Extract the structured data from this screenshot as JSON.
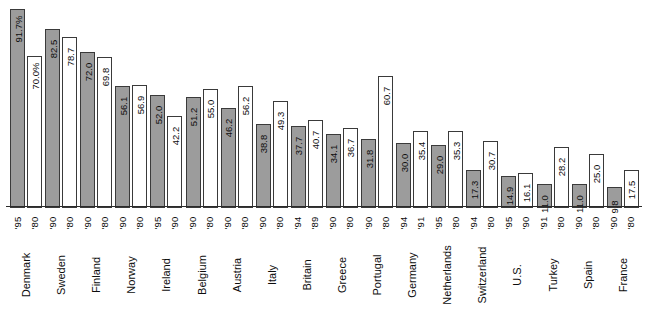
{
  "chart_data": {
    "type": "bar",
    "title": "",
    "subtitle": "",
    "xlabel": "",
    "ylabel": "",
    "ylim": [
      0,
      95
    ],
    "grid": false,
    "legend_position": "none",
    "orientation": "vertical",
    "categories": [
      "Denmark",
      "Sweden",
      "Finland",
      "Norway",
      "Ireland",
      "Belgium",
      "Austria",
      "Italy",
      "Britain",
      "Greece",
      "Portugal",
      "Germany",
      "Netherlands",
      "Switzerland",
      "U.S.",
      "Turkey",
      "Spain",
      "France"
    ],
    "series": [
      {
        "name": "recent",
        "style": "gray",
        "values": [
          91.7,
          82.5,
          72.0,
          56.1,
          52.0,
          51.2,
          46.2,
          38.8,
          37.7,
          34.1,
          31.8,
          30.0,
          29.0,
          17.3,
          14.9,
          11.0,
          11.0,
          9.8
        ],
        "labels": [
          "91.7%",
          "82.5",
          "72.0",
          "56.1",
          "52.0",
          "51.2",
          "46.2",
          "38.8",
          "37.7",
          "34.1",
          "31.8",
          "30.0",
          "29.0",
          "17.3",
          "14.9",
          "11.0",
          "11.0",
          "9.8"
        ],
        "years": [
          "'95",
          "'90",
          "'90",
          "'90",
          "'95",
          "'90",
          "'90",
          "'90",
          "'94",
          "'90",
          "'90",
          "'94",
          "'95",
          "'94",
          "'95",
          "'91",
          "'90",
          "'90"
        ]
      },
      {
        "name": "earlier",
        "style": "white",
        "values": [
          70.0,
          78.7,
          69.8,
          56.9,
          42.2,
          55.0,
          56.2,
          49.3,
          40.7,
          36.7,
          60.7,
          35.4,
          35.3,
          30.7,
          16.1,
          28.2,
          25.0,
          17.5
        ],
        "labels": [
          "70.0%",
          "78.7",
          "69.8",
          "56.9",
          "42.2",
          "55.0",
          "56.2",
          "49.3",
          "40.7",
          "36.7",
          "60.7",
          "35.4",
          "35.3",
          "30.7",
          "16.1",
          "28.2",
          "25.0",
          "17.5"
        ],
        "years": [
          "'80",
          "'80",
          "'80",
          "'80",
          "'90",
          "'80",
          "'80",
          "'80",
          "'89",
          "'80",
          "'80",
          "'91",
          "'80",
          "'80",
          "'90",
          "'80",
          "'80",
          "'80"
        ]
      }
    ],
    "colors": {
      "gray_bar": "#9c9c9c",
      "white_bar": "#ffffff",
      "bar_border": "#3a3a3a",
      "axis": "#2b2b2b",
      "text": "#0d0d0d"
    }
  }
}
